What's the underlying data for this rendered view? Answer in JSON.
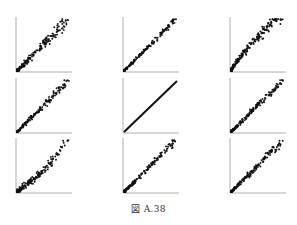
{
  "caption": "図 A.38",
  "chart_data": {
    "type": "scatter",
    "title": "",
    "layout": {
      "rows": 3,
      "cols": 3,
      "grid": false,
      "legend": "none"
    },
    "panels": [
      {
        "row": 1,
        "col": 1,
        "xlabel": "",
        "ylabel": "",
        "spread": 0.1,
        "curve": "linear-fan",
        "n": 170,
        "description": "positively correlated cloud, wider scatter at high end"
      },
      {
        "row": 1,
        "col": 2,
        "xlabel": "",
        "ylabel": "",
        "spread": 0.05,
        "curve": "linear",
        "n": 170,
        "description": "tight positive linear relation"
      },
      {
        "row": 1,
        "col": 3,
        "xlabel": "",
        "ylabel": "",
        "spread": 0.12,
        "curve": "concave",
        "n": 190,
        "description": "positive, steep lower part, dense cloud at low values"
      },
      {
        "row": 2,
        "col": 1,
        "xlabel": "",
        "ylabel": "",
        "spread": 0.07,
        "curve": "linear",
        "n": 170,
        "description": "positive linear with moderate scatter"
      },
      {
        "row": 2,
        "col": 2,
        "xlabel": "",
        "ylabel": "",
        "spread": 0.0,
        "curve": "identity",
        "n": 200,
        "description": "perfect diagonal line y = x"
      },
      {
        "row": 2,
        "col": 3,
        "xlabel": "",
        "ylabel": "",
        "spread": 0.07,
        "curve": "linear",
        "n": 170,
        "description": "positive linear with some outliers above line"
      },
      {
        "row": 3,
        "col": 1,
        "xlabel": "",
        "ylabel": "",
        "spread": 0.1,
        "curve": "kinked",
        "n": 180,
        "description": "dense cluster at low values then steeper rise at high end"
      },
      {
        "row": 3,
        "col": 2,
        "xlabel": "",
        "ylabel": "",
        "spread": 0.07,
        "curve": "linear",
        "n": 170,
        "description": "positive linear with moderate scatter"
      },
      {
        "row": 3,
        "col": 3,
        "xlabel": "",
        "ylabel": "",
        "spread": 0.08,
        "curve": "linear",
        "n": 180,
        "description": "positive linear, dense at low end"
      }
    ],
    "xlim": [
      0,
      1
    ],
    "ylim": [
      0,
      1
    ]
  },
  "style": {
    "point_color": "#111111",
    "axis_color": "#999999"
  }
}
